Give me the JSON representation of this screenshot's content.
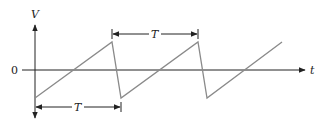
{
  "diagram": {
    "axes": {
      "y_label": "V",
      "x_label": "t",
      "origin_label": "0"
    },
    "period_labels": {
      "top": "T",
      "bottom": "T"
    },
    "colors": {
      "axis": "#222222",
      "waveform": "#8a8a8a",
      "annotation": "#222222"
    },
    "waveform": {
      "type": "sawtooth",
      "points": [
        [
          35,
          98
        ],
        [
          112,
          42
        ],
        [
          121,
          98
        ],
        [
          198,
          42
        ],
        [
          207,
          98
        ],
        [
          282,
          42
        ]
      ]
    }
  }
}
